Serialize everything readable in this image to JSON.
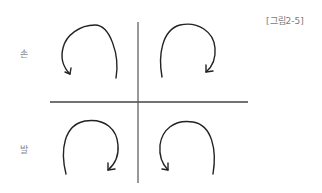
{
  "figure": {
    "caption": "[그림2-5]",
    "row_labels": {
      "top": "손",
      "bottom": "발"
    },
    "quadrants": [
      {
        "position": "top-left",
        "row": "손",
        "direction": "counter-clockwise",
        "arrow_end": "bottom-left"
      },
      {
        "position": "top-right",
        "row": "손",
        "direction": "clockwise",
        "arrow_end": "bottom-right"
      },
      {
        "position": "bottom-left",
        "row": "발",
        "direction": "clockwise",
        "arrow_end": "bottom-right"
      },
      {
        "position": "bottom-right",
        "row": "발",
        "direction": "counter-clockwise",
        "arrow_end": "bottom-left"
      }
    ],
    "colors": {
      "stroke": "#222222",
      "axis": "#444444",
      "label": "#8a8a8a"
    }
  }
}
